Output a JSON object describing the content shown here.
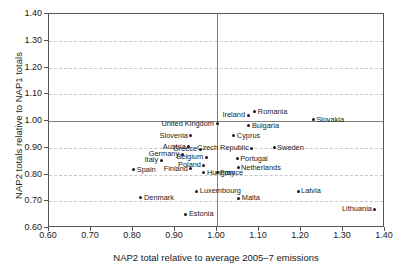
{
  "chart_data": {
    "type": "scatter",
    "title": "",
    "xlabel": "NAP2 total relative to average 2005–7 emissions",
    "ylabel": "NAP2 totals relative to NAP1 totals",
    "xlim": [
      0.6,
      1.4
    ],
    "ylim": [
      0.6,
      1.4
    ],
    "xticks": [
      "0.60",
      "0.70",
      "0.80",
      "0.90",
      "1.00",
      "1.10",
      "1.20",
      "1.30",
      "1.40"
    ],
    "yticks": [
      "1.40",
      "1.30",
      "1.20",
      "1.10",
      "1.00",
      "0.90",
      "0.80",
      "0.70",
      "0.60"
    ],
    "grid": "horizontal-dashed",
    "reference_lines": {
      "vertical_x": 1.0,
      "horizontal_y": 1.0
    },
    "legend": "none",
    "marker_color": "#1a1a1a",
    "points": [
      {
        "label": "Slovakia",
        "x": 1.229,
        "y": 1.005,
        "side": "right"
      },
      {
        "label": "Romania",
        "x": 1.09,
        "y": 1.035,
        "side": "right"
      },
      {
        "label": "Ireland",
        "x": 1.074,
        "y": 1.022,
        "side": "left"
      },
      {
        "label": "United Kingdom",
        "x": 1.0,
        "y": 0.99,
        "side": "left"
      },
      {
        "label": "Bulgaria",
        "x": 1.076,
        "y": 0.982,
        "side": "right"
      },
      {
        "label": "Cyprus",
        "x": 1.04,
        "y": 0.944,
        "side": "right"
      },
      {
        "label": "Slovenia",
        "x": 0.938,
        "y": 0.945,
        "side": "left"
      },
      {
        "label": "Austria",
        "x": 0.933,
        "y": 0.904,
        "side": "left"
      },
      {
        "label": "Greece",
        "x": 0.96,
        "y": 0.894,
        "side": "left"
      },
      {
        "label": "Czech Republic",
        "x": 1.083,
        "y": 0.898,
        "side": "left"
      },
      {
        "label": "Sweden",
        "x": 1.136,
        "y": 0.9,
        "side": "right"
      },
      {
        "label": "Germany",
        "x": 0.917,
        "y": 0.876,
        "side": "left"
      },
      {
        "label": "Italy",
        "x": 0.867,
        "y": 0.854,
        "side": "left"
      },
      {
        "label": "Belgium",
        "x": 0.974,
        "y": 0.864,
        "side": "left"
      },
      {
        "label": "Portugal",
        "x": 1.048,
        "y": 0.859,
        "side": "right"
      },
      {
        "label": "Poland",
        "x": 0.969,
        "y": 0.834,
        "side": "left"
      },
      {
        "label": "Netherlands",
        "x": 1.05,
        "y": 0.826,
        "side": "right"
      },
      {
        "label": "Spain",
        "x": 0.802,
        "y": 0.817,
        "side": "right"
      },
      {
        "label": "Finland",
        "x": 0.938,
        "y": 0.821,
        "side": "left"
      },
      {
        "label": "Hungary",
        "x": 0.969,
        "y": 0.806,
        "side": "right"
      },
      {
        "label": "France",
        "x": 1.0,
        "y": 0.806,
        "side": "right"
      },
      {
        "label": "Denmark",
        "x": 0.819,
        "y": 0.714,
        "side": "right"
      },
      {
        "label": "Luxembourg",
        "x": 0.952,
        "y": 0.738,
        "side": "right"
      },
      {
        "label": "Latvia",
        "x": 1.193,
        "y": 0.738,
        "side": "right"
      },
      {
        "label": "Malta",
        "x": 1.052,
        "y": 0.712,
        "side": "right"
      },
      {
        "label": "Lithuania",
        "x": 1.376,
        "y": 0.671,
        "side": "left"
      },
      {
        "label": "Estonia",
        "x": 0.926,
        "y": 0.651,
        "side": "right"
      }
    ]
  }
}
